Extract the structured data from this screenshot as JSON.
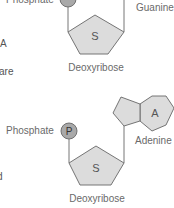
{
  "figure": {
    "top_nucleotide": {
      "phosphate_label": "Phosphate",
      "phosphate_symbol": "P",
      "sugar_symbol": "S",
      "sugar_label": "Deoxyribose",
      "base_label": "Guanine"
    },
    "bottom_nucleotide": {
      "phosphate_label": "Phosphate",
      "phosphate_symbol": "P",
      "sugar_symbol": "S",
      "sugar_label": "Deoxyribose",
      "base_symbol": "A",
      "base_label": "Adenine"
    },
    "left_margin_fragments": [
      "A",
      "are",
      "d"
    ],
    "colors": {
      "shape_fill": "#dcdcdc",
      "phosphate_fill": "#a9a9a9",
      "stroke": "#666666",
      "label": "#6a6a6a"
    }
  }
}
